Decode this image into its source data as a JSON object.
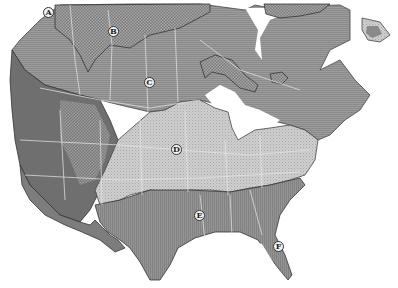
{
  "map": {
    "title": "",
    "region": "North America (Canada, USA)",
    "style": "grayscale hatched zone map",
    "zones": [
      {
        "id": "tundra",
        "pattern": "cross-hatch",
        "color": "#8a8a8a"
      },
      {
        "id": "boreal",
        "pattern": "horizontal-lines",
        "color": "#9a9a9a"
      },
      {
        "id": "mountain",
        "pattern": "dark-fill",
        "color": "#6e6e6e"
      },
      {
        "id": "temperate",
        "pattern": "light-dots",
        "color": "#c4c4c4"
      },
      {
        "id": "southern",
        "pattern": "vertical-lines",
        "color": "#8c8c8c"
      }
    ],
    "colors": {
      "background": "#ffffff",
      "water": "#ffffff",
      "border_lines": "#e8e8e8",
      "outline": "#333333"
    },
    "markers": [
      {
        "label": "A",
        "x": 48,
        "y": 12
      },
      {
        "label": "B",
        "x": 113,
        "y": 31
      },
      {
        "label": "C",
        "x": 149,
        "y": 82
      },
      {
        "label": "D",
        "x": 176,
        "y": 149
      },
      {
        "label": "E",
        "x": 199,
        "y": 215
      },
      {
        "label": "F",
        "x": 278,
        "y": 246
      }
    ]
  }
}
